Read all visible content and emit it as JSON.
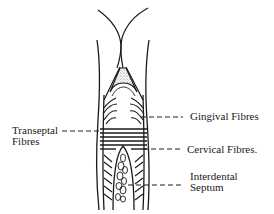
{
  "diagram": {
    "labels": {
      "gingival": "Gingival Fibres",
      "transeptal_line1": "Transeptal",
      "transeptal_line2": "Fibres",
      "cervical": "Cervical Fibres.",
      "interdental_line1": "Interdental",
      "interdental_line2": "Septum"
    },
    "colors": {
      "ink": "#1a1a1a",
      "background": "#ffffff"
    }
  }
}
